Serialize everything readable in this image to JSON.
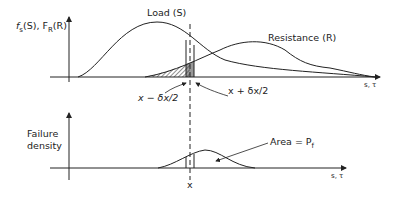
{
  "top_plot": {
    "y_axis_label": {
      "f": "f",
      "f_sub": "s",
      "arg1": "(S), ",
      "F": "F",
      "F_sub": "R",
      "arg2": "(R)"
    },
    "x_axis_label": "s, τ",
    "curves": [
      {
        "name": "Load (S)",
        "label": "Load (S)"
      },
      {
        "name": "Resistance (R)",
        "label": "Resistance (R)"
      }
    ],
    "annotations": {
      "left_bound": "x − δx/2",
      "right_bound": "x + δx/2"
    }
  },
  "bottom_plot": {
    "y_axis_label_line1": "Failure",
    "y_axis_label_line2": "density",
    "x_axis_label": "s, τ",
    "x_marker": "x",
    "area_label": "Area = P",
    "area_label_sub": "f"
  },
  "colors": {
    "line": "#222222",
    "background": "#ffffff"
  }
}
